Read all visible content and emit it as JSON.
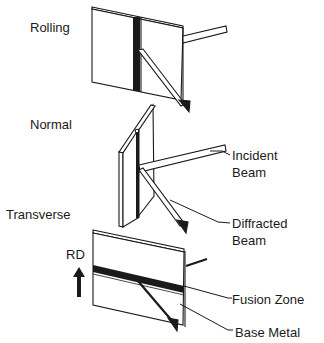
{
  "diagram": {
    "orientations": {
      "rolling": "Rolling",
      "normal": "Normal",
      "transverse": "Transverse"
    },
    "beams": {
      "incident_line1": "Incident",
      "incident_line2": "Beam",
      "diffracted_line1": "Diffracted",
      "diffracted_line2": "Beam"
    },
    "regions": {
      "fusion_zone": "Fusion Zone",
      "base_metal": "Base Metal"
    },
    "direction": {
      "rd": "RD"
    },
    "colors": {
      "ink": "#1a1a1a",
      "background": "#ffffff"
    }
  }
}
